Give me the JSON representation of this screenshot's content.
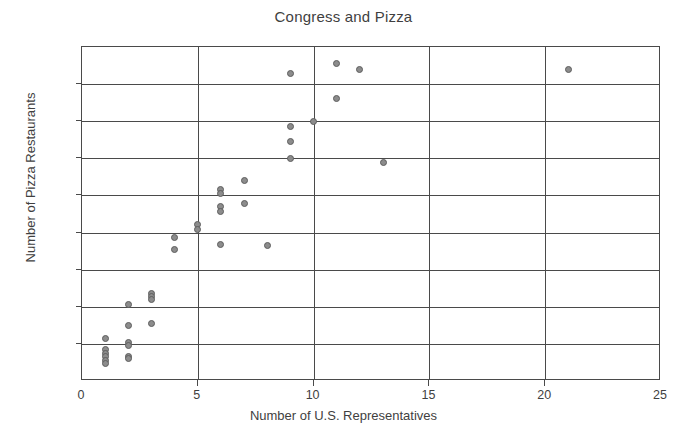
{
  "chart_data": {
    "type": "scatter",
    "title": "Congress and Pizza",
    "xlabel": "Number of U.S. Representatives",
    "ylabel": "Number of Pizza Restaurants",
    "xlim": [
      0,
      25
    ],
    "ylim": [
      0,
      1800
    ],
    "xticks": [
      "0",
      "5",
      "10",
      "15",
      "20",
      "25"
    ],
    "xtick_values": [
      0,
      5,
      10,
      15,
      20,
      25
    ],
    "yticks": [
      "0",
      "200",
      "400",
      "600",
      "800",
      "1000",
      "1200",
      "1400",
      "1600",
      "1800"
    ],
    "ytick_values": [
      0,
      200,
      400,
      600,
      800,
      1000,
      1200,
      1400,
      1600,
      1800
    ],
    "grid": "major gridlines on both axes",
    "legend": "none",
    "marker": {
      "shape": "circle",
      "fill": "#8c8c8c",
      "edge": "#5e5e5e",
      "size": 7
    },
    "points": [
      {
        "x": 1,
        "y": 230
      },
      {
        "x": 1,
        "y": 170
      },
      {
        "x": 1,
        "y": 150
      },
      {
        "x": 1,
        "y": 130
      },
      {
        "x": 1,
        "y": 110
      },
      {
        "x": 1,
        "y": 95
      },
      {
        "x": 2,
        "y": 410
      },
      {
        "x": 2,
        "y": 300
      },
      {
        "x": 2,
        "y": 205
      },
      {
        "x": 2,
        "y": 190
      },
      {
        "x": 2,
        "y": 130
      },
      {
        "x": 2,
        "y": 120
      },
      {
        "x": 3,
        "y": 470
      },
      {
        "x": 3,
        "y": 455
      },
      {
        "x": 3,
        "y": 440
      },
      {
        "x": 3,
        "y": 310
      },
      {
        "x": 4,
        "y": 775
      },
      {
        "x": 4,
        "y": 710
      },
      {
        "x": 5,
        "y": 845
      },
      {
        "x": 5,
        "y": 815
      },
      {
        "x": 6,
        "y": 1030
      },
      {
        "x": 6,
        "y": 1010
      },
      {
        "x": 6,
        "y": 940
      },
      {
        "x": 6,
        "y": 915
      },
      {
        "x": 6,
        "y": 735
      },
      {
        "x": 7,
        "y": 1080
      },
      {
        "x": 7,
        "y": 955
      },
      {
        "x": 8,
        "y": 730
      },
      {
        "x": 9,
        "y": 1655
      },
      {
        "x": 9,
        "y": 1370
      },
      {
        "x": 9,
        "y": 1290
      },
      {
        "x": 9,
        "y": 1200
      },
      {
        "x": 10,
        "y": 1400
      },
      {
        "x": 11,
        "y": 1710
      },
      {
        "x": 11,
        "y": 1520
      },
      {
        "x": 12,
        "y": 1680
      },
      {
        "x": 13,
        "y": 1180
      },
      {
        "x": 21,
        "y": 1680
      }
    ]
  }
}
